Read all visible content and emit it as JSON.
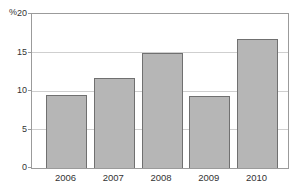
{
  "chart_data": {
    "type": "bar",
    "title": "",
    "xlabel": "",
    "ylabel": "%",
    "y_unit": "%",
    "categories": [
      "2006",
      "2007",
      "2008",
      "2009",
      "2010"
    ],
    "values": [
      9.5,
      11.7,
      14.9,
      9.3,
      16.7
    ],
    "ylim": [
      0,
      20
    ],
    "yticks": [
      0,
      5,
      10,
      15,
      20
    ],
    "grid": true,
    "legend": false,
    "style": {
      "background": "#ffffff",
      "plot_background": "#ffffff",
      "bar_fill": "#b6b6b6",
      "bar_border": "#707070",
      "gridline_color": "#cfcfcf",
      "axis_color": "#9b9b9b",
      "text_color": "#333333"
    }
  }
}
